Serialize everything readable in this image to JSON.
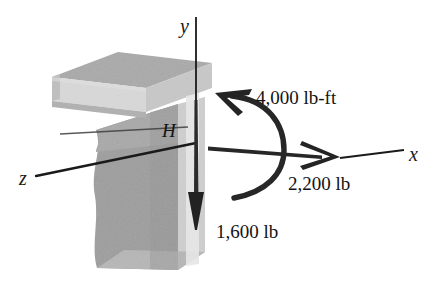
{
  "figure": {
    "kind": "free-body-diagram",
    "background_color": "#ffffff"
  },
  "axes": {
    "y": {
      "label": "y",
      "direction": "up"
    },
    "x": {
      "label": "x",
      "direction": "right"
    },
    "z": {
      "label": "z",
      "direction": "lower-left"
    }
  },
  "point": {
    "label": "H"
  },
  "loads": [
    {
      "name": "moment",
      "label": "4,000 lb-ft",
      "kind": "couple-moment",
      "magnitude": 4000,
      "units": "lb-ft",
      "axis": "x"
    },
    {
      "name": "horizontal-force",
      "label": "2,200 lb",
      "kind": "force",
      "magnitude": 2200,
      "units": "lb",
      "direction": "+x"
    },
    {
      "name": "vertical-force",
      "label": "1,600 lb",
      "kind": "force",
      "magnitude": 1600,
      "units": "lb",
      "direction": "-y"
    }
  ],
  "colors": {
    "slab_top": "#a9a9a9",
    "slab_front": "#d9d9d9",
    "slab_side": "#c6c6c6",
    "wall_front": "#9d9d9d",
    "wall_upper": "#a6a6a6",
    "wall_side": "#cfcfcf",
    "wall_bottom": "#b5b5b5",
    "line": "#1a1a1a",
    "arrow": "#232323",
    "text": "#131313"
  }
}
